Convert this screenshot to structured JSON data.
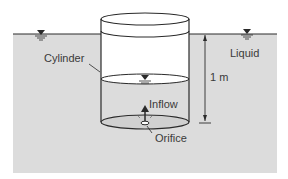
{
  "diagram": {
    "colors": {
      "liquid": "#dcdcdc",
      "line": "#2a2a2a",
      "background": "#ffffff"
    },
    "labels": {
      "cylinder": "Cylinder",
      "liquid": "Liquid",
      "height": "1 m",
      "inflow": "Inflow",
      "orifice": "Orifice"
    },
    "symbols": {
      "free_surface_marker": "inverted-triangle-water-level-icon"
    }
  }
}
